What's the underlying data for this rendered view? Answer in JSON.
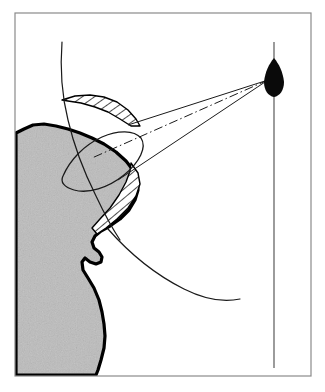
{
  "figure": {
    "caption": "",
    "width": 325,
    "height": 392,
    "background_color": "#ffffff"
  },
  "frame": {
    "name": "figure-border",
    "x": 15,
    "y": 13,
    "width": 296,
    "height": 363,
    "stroke_color": "#8a8a8a",
    "stroke_width": 1.2,
    "fill": "none"
  },
  "land": {
    "label": "landmass",
    "fill_color": "#bcbcbc",
    "outline_color": "#000000",
    "outline_width": 3.2,
    "texture": "stipple-noise",
    "path": "M 16,133 L 24,129 L 33,125 L 44,124 L 56,126 L 68,129 L 80,133 L 92,138 L 104,144 L 116,152 L 126,161 L 133,170 L 137,180 L 138,190 L 135,200 L 129,210 L 120,219 L 110,226 L 101,231 L 95,236 L 92,242 L 94,248 L 99,252 L 102,257 L 101,262 L 96,264 L 90,262 L 85,258 L 82,262 L 83,270 L 88,278 L 94,288 L 99,300 L 102,312 L 104,324 L 105,336 L 104,348 L 101,360 L 98,370 L 96,375 L 16,375 Z"
  },
  "vessel": {
    "label": "ship-silhouette",
    "fill_color": "#0a0a0a",
    "center_x": 274,
    "center_y": 78,
    "length": 38,
    "beam": 18,
    "heading": "north",
    "path": "M 274,58 C 279,64 283,72 284,82 C 284,90 280,96 274,97 C 268,96 264,90 264,82 C 265,72 269,64 274,58 Z"
  },
  "track_line": {
    "label": "vessel-track",
    "x": 274,
    "y_start": 42,
    "y_end": 368,
    "stroke_color": "#4a4a4a",
    "stroke_width": 1.1,
    "style": "solid"
  },
  "beam": {
    "label": "radar-beam",
    "apex_x": 268,
    "apex_y": 80,
    "edge_upper": {
      "x2": 128,
      "y2": 125
    },
    "edge_lower": {
      "x2": 118,
      "y2": 180
    },
    "stroke_color": "#1a1a1a",
    "stroke_width": 1.0,
    "centerline": {
      "label": "beam-centerline",
      "x1": 268,
      "y1": 80,
      "x2": 92,
      "y2": 158,
      "style": "dash-dot",
      "dasharray": "9,3,1.5,3",
      "stroke_width": 1.0
    }
  },
  "shadow_sectors": [
    {
      "label": "upper-shadow-sector",
      "hatch_angle_deg": 55,
      "hatch_spacing": 7,
      "stroke_color": "#000000",
      "stroke_width": 1.4,
      "path": "M 62,100 L 75,96 L 90,95 L 104,97 L 117,102 L 128,110 L 136,119 L 140,126 L 131,126 L 120,119 L 108,112 L 95,107 L 81,103 L 68,101 Z"
    },
    {
      "label": "lower-shadow-sector",
      "hatch_angle_deg": 50,
      "hatch_spacing": 7,
      "stroke_color": "#000000",
      "stroke_width": 1.4,
      "path": "M 131,163 L 138,173 L 140,184 L 136,196 L 128,208 L 117,219 L 106,228 L 97,234 L 92,228 L 100,219 L 110,208 L 119,195 L 126,182 L 130,171 Z"
    }
  ],
  "beam_footprint": {
    "label": "beam-footprint-ellipse",
    "stroke_color": "#1a1a1a",
    "stroke_width": 1.3,
    "fill": "none",
    "center_x": 110,
    "center_y": 158,
    "rx": 52,
    "ry": 22,
    "rotation_deg": -22,
    "path": "M 63,176 C 70,160 84,145 102,137 C 118,130 134,130 141,138 C 147,147 140,162 124,175 C 108,188 88,194 74,190 C 64,187 60,182 63,176 Z"
  },
  "curves": [
    {
      "label": "upper-range-arc",
      "stroke_color": "#1a1a1a",
      "stroke_width": 1.2,
      "path": "M 62,42 C 60,68 62,96 68,120 C 74,146 84,172 96,196 C 104,213 112,228 120,240"
    },
    {
      "label": "lower-range-arc",
      "stroke_color": "#1a1a1a",
      "stroke_width": 1.2,
      "path": "M 108,229 C 130,254 156,275 184,289 C 204,299 222,303 240,299"
    }
  ],
  "colors": {
    "land_gray": "#bcbcbc",
    "ink_black": "#000000",
    "frame_gray": "#8a8a8a",
    "paper_white": "#ffffff"
  }
}
